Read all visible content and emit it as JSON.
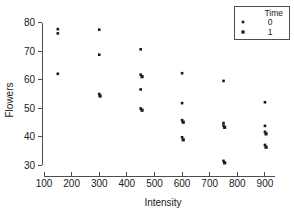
{
  "chart_data": {
    "type": "scatter",
    "title": "",
    "xlabel": "Intensity",
    "ylabel": "Flowers",
    "xlim": [
      100,
      940
    ],
    "ylim": [
      29,
      81
    ],
    "xticks": [
      100,
      200,
      300,
      400,
      500,
      600,
      700,
      800,
      900
    ],
    "yticks": [
      30,
      40,
      50,
      60,
      70,
      80
    ],
    "grid": false,
    "legend": {
      "title": "Time",
      "position": "top-right",
      "entries": [
        {
          "label": "0",
          "marker": "small-square",
          "color": "#1a1a1a"
        },
        {
          "label": "1",
          "marker": "square",
          "color": "#1a1a1a"
        }
      ]
    },
    "series": [
      {
        "name": "0",
        "marker": "small-square",
        "color": "#1a1a1a",
        "points": [
          {
            "x": 150,
            "y": 77.8
          },
          {
            "x": 150,
            "y": 76.3
          },
          {
            "x": 150,
            "y": 62.1
          },
          {
            "x": 300,
            "y": 77.6
          },
          {
            "x": 300,
            "y": 68.8
          },
          {
            "x": 300,
            "y": 55.0
          },
          {
            "x": 450,
            "y": 70.7
          },
          {
            "x": 450,
            "y": 61.8
          },
          {
            "x": 450,
            "y": 56.6
          },
          {
            "x": 450,
            "y": 49.9
          },
          {
            "x": 600,
            "y": 62.3
          },
          {
            "x": 600,
            "y": 51.8
          },
          {
            "x": 600,
            "y": 45.8
          },
          {
            "x": 600,
            "y": 39.8
          },
          {
            "x": 750,
            "y": 59.6
          },
          {
            "x": 750,
            "y": 44.8
          },
          {
            "x": 750,
            "y": 43.9
          },
          {
            "x": 750,
            "y": 31.5
          },
          {
            "x": 900,
            "y": 52.1
          },
          {
            "x": 900,
            "y": 43.8
          },
          {
            "x": 900,
            "y": 41.7
          },
          {
            "x": 900,
            "y": 37.1
          }
        ]
      },
      {
        "name": "1",
        "marker": "square",
        "color": "#1a1a1a",
        "points": [
          {
            "x": 303,
            "y": 54.3
          },
          {
            "x": 455,
            "y": 61.1
          },
          {
            "x": 455,
            "y": 49.3
          },
          {
            "x": 604,
            "y": 45.1
          },
          {
            "x": 604,
            "y": 38.9
          },
          {
            "x": 754,
            "y": 43.3
          },
          {
            "x": 754,
            "y": 30.8
          },
          {
            "x": 904,
            "y": 41.0
          },
          {
            "x": 904,
            "y": 36.3
          }
        ]
      }
    ]
  }
}
